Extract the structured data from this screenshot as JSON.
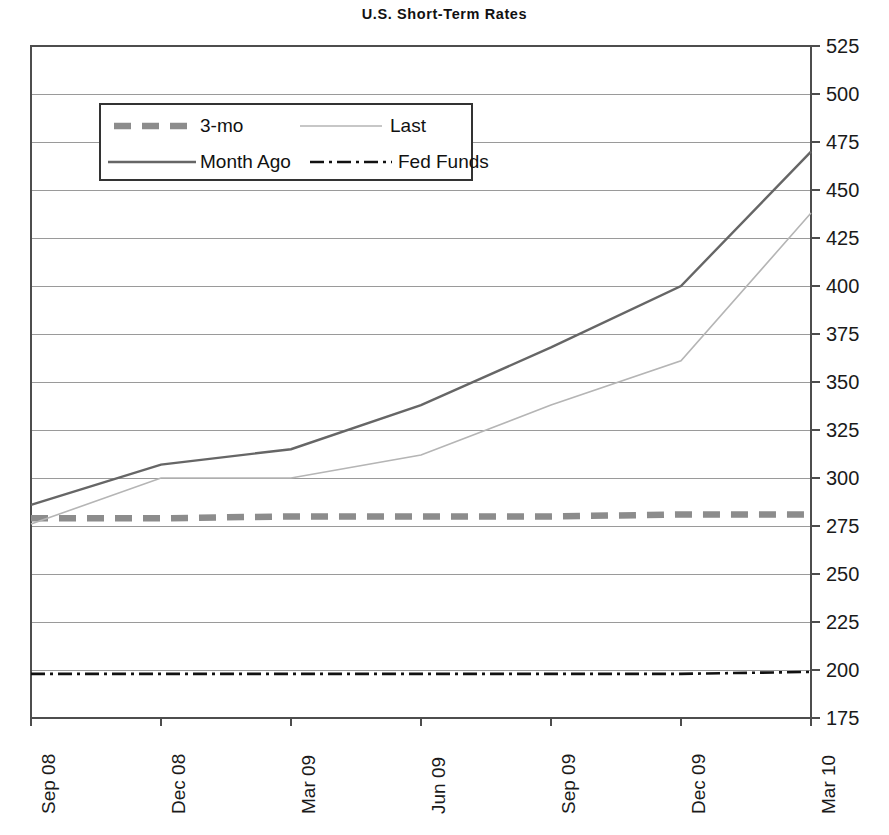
{
  "chart_data": {
    "type": "line",
    "title": "U.S. Short-Term Rates",
    "xlabel": "",
    "ylabel": "",
    "ylim": [
      175,
      525
    ],
    "ytick_step": 25,
    "grid": true,
    "legend_position": "upper-left-inside",
    "categories": [
      "Sep 08",
      "Dec 08",
      "Mar 09",
      "Jun 09",
      "Sep 09",
      "Dec 09",
      "Mar 10"
    ],
    "yticks": [
      525,
      500,
      475,
      450,
      425,
      400,
      375,
      350,
      325,
      300,
      275,
      250,
      225,
      200,
      175
    ],
    "series": [
      {
        "name": "3-mo",
        "style": "thick-dashed",
        "color": "#8c8c8c",
        "x": [
          "Sep 08",
          "Dec 08",
          "Mar 09",
          "Jun 09",
          "Sep 09",
          "Dec 09",
          "Mar 10"
        ],
        "values": [
          279,
          279,
          280,
          280,
          280,
          281,
          281
        ]
      },
      {
        "name": "Last",
        "style": "thin-solid",
        "color": "#b5b5b5",
        "x": [
          "Sep 08",
          "Dec 08",
          "Mar 09",
          "Jun 09",
          "Sep 09",
          "Dec 09",
          "Mar 10"
        ],
        "values": [
          276,
          300,
          300,
          312,
          338,
          361,
          438
        ]
      },
      {
        "name": "Month Ago",
        "style": "medium-solid",
        "color": "#666666",
        "x": [
          "Sep 08",
          "Dec 08",
          "Mar 09",
          "Jun 09",
          "Sep 09",
          "Dec 09",
          "Mar 10"
        ],
        "values": [
          286,
          307,
          315,
          338,
          368,
          400,
          470
        ]
      },
      {
        "name": "Fed Funds",
        "style": "dash-dot",
        "color": "#111111",
        "x": [
          "Sep 08",
          "Dec 08",
          "Mar 09",
          "Jun 09",
          "Sep 09",
          "Dec 09",
          "Mar 10"
        ],
        "values": [
          198,
          198,
          198,
          198,
          198,
          198,
          199
        ]
      }
    ],
    "legend": [
      {
        "label": "3-mo",
        "style": "thick-dashed",
        "color": "#8c8c8c"
      },
      {
        "label": "Last",
        "style": "thin-solid",
        "color": "#b5b5b5"
      },
      {
        "label": "Month Ago",
        "style": "medium-solid",
        "color": "#666666"
      },
      {
        "label": "Fed Funds",
        "style": "dash-dot",
        "color": "#111111"
      }
    ]
  },
  "colors": {
    "axis": "#4d4d4d",
    "grid": "#9a9a9a",
    "background": "#ffffff",
    "text": "#1a1a1a"
  }
}
